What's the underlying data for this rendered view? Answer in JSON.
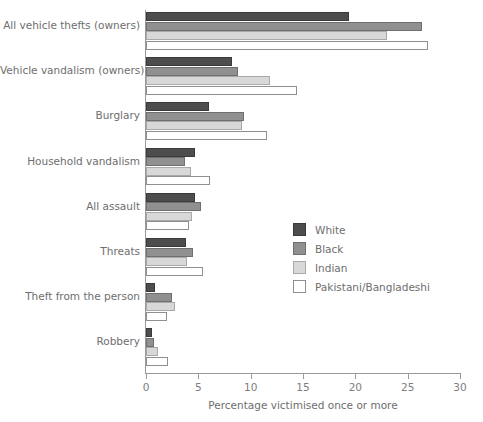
{
  "chart_data": {
    "type": "bar",
    "orientation": "horizontal",
    "title": "",
    "xlabel": "Percentage victimised once or more",
    "ylabel": "",
    "xlim": [
      0,
      30
    ],
    "xticks": [
      0,
      5,
      10,
      15,
      20,
      25,
      30
    ],
    "grid": false,
    "legend_position": "center-right",
    "categories": [
      "All vehicle thefts (owners)",
      "Vehicle vandalism (owners)",
      "Burglary",
      "Household vandalism",
      "All assault",
      "Threats",
      "Theft from the person",
      "Robbery"
    ],
    "series": [
      {
        "name": "White",
        "color": "#4d4d4d",
        "values": [
          19.4,
          8.2,
          6.0,
          4.7,
          4.7,
          3.8,
          0.9,
          0.6
        ]
      },
      {
        "name": "Black",
        "color": "#909090",
        "values": [
          26.4,
          8.8,
          9.4,
          3.7,
          5.3,
          4.5,
          2.5,
          0.8
        ]
      },
      {
        "name": "Indian",
        "color": "#d8d8d8",
        "values": [
          23.0,
          11.8,
          9.2,
          4.3,
          4.4,
          3.9,
          2.8,
          1.1
        ]
      },
      {
        "name": "Pakistani/Bangladeshi",
        "color": "#ffffff",
        "values": [
          26.9,
          14.4,
          11.6,
          6.1,
          4.1,
          5.4,
          2.0,
          2.1
        ]
      }
    ]
  }
}
